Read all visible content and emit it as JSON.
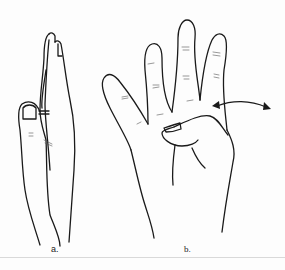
{
  "figure": {
    "panels": [
      {
        "id": "a",
        "label": "a.",
        "description": "Hand viewed from the side with thumb and fingers, arrows near thumb joint"
      },
      {
        "id": "b",
        "label": "b.",
        "description": "Palm view with four fingers extended and thumb folded; double-headed arrow indicating little finger abduction"
      }
    ],
    "colors": {
      "line": "#1a1a1a",
      "background": "#fdfdfd"
    }
  }
}
